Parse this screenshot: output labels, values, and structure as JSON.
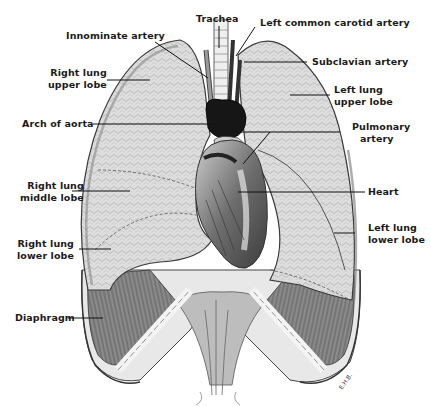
{
  "figure": {
    "colors": {
      "ink": "#1a1a1a",
      "lung": "#d9d9d9",
      "lung_shadow": "#a8a8a8",
      "heart": "#6b6b6b",
      "aorta": "#151515",
      "diaphragm": "#7a7a7a",
      "background": "#ffffff"
    },
    "signature": "E.H.B.",
    "labels": [
      {
        "id": "trachea",
        "text": "Trachea"
      },
      {
        "id": "left-common-carotid-artery",
        "text": "Left common carotid artery"
      },
      {
        "id": "innominate-artery",
        "text": "Innominate artery"
      },
      {
        "id": "subclavian-artery",
        "text": "Subclavian artery"
      },
      {
        "id": "right-lung-upper-lobe",
        "line1": "Right lung",
        "line2": "upper lobe"
      },
      {
        "id": "left-lung-upper-lobe",
        "line1": "Left lung",
        "line2": "upper lobe"
      },
      {
        "id": "arch-of-aorta",
        "text": "Arch of aorta"
      },
      {
        "id": "pulmonary-artery",
        "line1": "Pulmonary",
        "line2": "artery"
      },
      {
        "id": "right-lung-middle-lobe",
        "line1": "Right lung",
        "line2": "middle lobe"
      },
      {
        "id": "heart",
        "text": "Heart"
      },
      {
        "id": "left-lung-lower-lobe",
        "line1": "Left lung",
        "line2": "lower lobe"
      },
      {
        "id": "right-lung-lower-lobe",
        "line1": "Right lung",
        "line2": "lower lobe"
      },
      {
        "id": "diaphragm",
        "text": "Diaphragm"
      }
    ]
  }
}
